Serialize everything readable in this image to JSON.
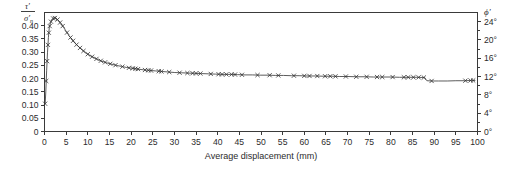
{
  "chart_data": {
    "type": "line",
    "title": "",
    "subtitle": "",
    "xlabel": "Average displacement (mm)",
    "ylabel": "t'/s'n",
    "ylabel_numerator": "τ′",
    "ylabel_denominator": "σ′",
    "ylabel_denominator_sub": "n",
    "ylabel_right": "ϕ′",
    "xlim": [
      0,
      100
    ],
    "ylim": [
      0,
      0.45
    ],
    "ylim_right": [
      0,
      26
    ],
    "grid": false,
    "legend": null,
    "marker": "x",
    "line_color": "#4a4a4a",
    "xticks": [
      0,
      5,
      10,
      15,
      20,
      25,
      30,
      35,
      40,
      45,
      50,
      55,
      60,
      65,
      70,
      75,
      80,
      85,
      90,
      95,
      100
    ],
    "xticklabels": [
      "0",
      "5",
      "10",
      "15",
      "20",
      "25",
      "30",
      "35",
      "40",
      "45",
      "50",
      "55",
      "60",
      "65",
      "70",
      "75",
      "80",
      "85",
      "90",
      "95",
      "100"
    ],
    "yticks": [
      0,
      0.05,
      0.1,
      0.15,
      0.2,
      0.25,
      0.3,
      0.35,
      0.4
    ],
    "yticklabels": [
      "0",
      "0.05",
      "0.10",
      "0.15",
      "0.20",
      "0.25",
      "0.30",
      "0.35",
      "0.40"
    ],
    "yticks_right": [
      0,
      4,
      8,
      12,
      16,
      20,
      24
    ],
    "yticklabels_right": [
      "0°",
      "4°",
      "8°",
      "12°",
      "16°",
      "20°",
      "24°"
    ],
    "series": [
      {
        "name": "shear stress ratio",
        "x": [
          0.15,
          0.3,
          0.5,
          0.7,
          0.9,
          1.1,
          1.4,
          1.8,
          2.2,
          2.7,
          3.2,
          3.8,
          4.4,
          5.0,
          5.6,
          6.3,
          7.0,
          7.8,
          8.6,
          9.4,
          10.3,
          11.2,
          12.2,
          13.2,
          14.3,
          15.4,
          16.6,
          17.8,
          19.0,
          20.3,
          21.6,
          22.9,
          24.3,
          25.7,
          27.1,
          28.6,
          30.1,
          31.6,
          33.1,
          34.7,
          36.3,
          37.9,
          39.5,
          41.2,
          42.9,
          44.6,
          46.3,
          48.0,
          49.8,
          51.6,
          53.4,
          55.2,
          57.0,
          58.8,
          60.6,
          62.5,
          64.4,
          66.3,
          68.2,
          70.1,
          72.0,
          74.0,
          76.0,
          78.0,
          80.0,
          82.0,
          84.0,
          86.0,
          87.8,
          88.3,
          89.5,
          91.0,
          93.0,
          95.0,
          97.0,
          98.5,
          99.5
        ],
        "y": [
          0.105,
          0.15,
          0.232,
          0.3,
          0.355,
          0.392,
          0.412,
          0.425,
          0.43,
          0.428,
          0.42,
          0.408,
          0.394,
          0.379,
          0.364,
          0.349,
          0.335,
          0.322,
          0.31,
          0.299,
          0.289,
          0.281,
          0.273,
          0.266,
          0.26,
          0.255,
          0.25,
          0.246,
          0.242,
          0.239,
          0.236,
          0.233,
          0.231,
          0.229,
          0.227,
          0.225,
          0.223,
          0.222,
          0.221,
          0.22,
          0.219,
          0.218,
          0.217,
          0.216,
          0.216,
          0.215,
          0.214,
          0.214,
          0.213,
          0.213,
          0.212,
          0.212,
          0.211,
          0.211,
          0.21,
          0.21,
          0.209,
          0.209,
          0.208,
          0.208,
          0.207,
          0.207,
          0.206,
          0.206,
          0.206,
          0.205,
          0.205,
          0.205,
          0.204,
          0.192,
          0.191,
          0.191,
          0.191,
          0.192,
          0.192,
          0.193,
          0.193
        ],
        "markers_x": [
          0.15,
          0.4,
          0.6,
          0.8,
          1.0,
          1.2,
          1.5,
          2.0,
          2.4,
          3.0,
          3.6,
          4.2,
          5.2,
          6.0,
          6.6,
          7.4,
          8.2,
          9.0,
          10.0,
          11.0,
          12.0,
          13.0,
          14.0,
          15.2,
          16.4,
          18.0,
          19.5,
          20.4,
          21.0,
          21.6,
          23.2,
          24.0,
          24.6,
          26.4,
          27.0,
          28.8,
          31.2,
          33.0,
          34.2,
          35.0,
          36.0,
          38.4,
          40.2,
          41.0,
          42.0,
          43.2,
          44.0,
          45.6,
          49.2,
          52.0,
          54.0,
          57.6,
          60.0,
          61.2,
          63.0,
          64.8,
          66.0,
          67.2,
          69.6,
          72.0,
          74.4,
          76.8,
          78.0,
          80.4,
          83.0,
          84.0,
          85.2,
          86.4,
          87.6,
          89.4,
          97.2,
          98.4,
          99.0
        ]
      }
    ]
  },
  "axis": {
    "x_title": "Average displacement (mm)"
  }
}
